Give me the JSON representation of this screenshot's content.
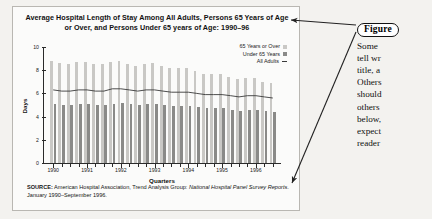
{
  "figure": {
    "title": "Average Hospital Length of Stay Among All Adults, Persons 65 Years of Age or Over, and Persons Under 65 years of Age: 1990–96",
    "source_prefix": "SOURCE:",
    "source_text_1": "American Hospital Association, Trend Analysis Group:",
    "source_italic": "National Hospital Panel Survey Reports",
    "source_text_2": ". January 1990–September 1996."
  },
  "callout": {
    "badge": "Figure",
    "lines": [
      "Some",
      "tell wr",
      "title, a",
      "Others",
      "should",
      "others",
      "below,",
      "expect",
      "reader"
    ]
  },
  "legend": {
    "items": [
      {
        "label": "65 Years or Over",
        "marker": "square-light-gray",
        "color": "#c9c8c5"
      },
      {
        "label": "Under 65 Years",
        "marker": "square-dark-gray",
        "color": "#8a8a88"
      },
      {
        "label": "All Adults",
        "marker": "line-dash",
        "color": "#3a3a3a"
      }
    ]
  },
  "chart_data": {
    "type": "bar",
    "title": "Average Hospital Length of Stay Among All Adults, Persons 65 Years of Age or Over, and Persons Under 65 years of Age: 1990–96",
    "xlabel": "Quarters",
    "ylabel": "Days",
    "ylim": [
      0,
      10
    ],
    "yticks": [
      0,
      2,
      4,
      6,
      8,
      10
    ],
    "ytick_labels": [
      "0",
      "2",
      "4",
      "6",
      "8",
      "10"
    ],
    "grid": false,
    "legend_position": "top-right",
    "x_axis_year_labels": [
      "1990",
      "1991",
      "1992",
      "1993",
      "1994",
      "1995",
      "1996"
    ],
    "x": [
      "1990 Q1",
      "1990 Q2",
      "1990 Q3",
      "1990 Q4",
      "1991 Q1",
      "1991 Q2",
      "1991 Q3",
      "1991 Q4",
      "1992 Q1",
      "1992 Q2",
      "1992 Q3",
      "1992 Q4",
      "1993 Q1",
      "1993 Q2",
      "1993 Q3",
      "1993 Q4",
      "1994 Q1",
      "1994 Q2",
      "1994 Q3",
      "1994 Q4",
      "1995 Q1",
      "1995 Q2",
      "1995 Q3",
      "1995 Q4",
      "1996 Q1",
      "1996 Q2",
      "1996 Q3"
    ],
    "series": [
      {
        "name": "65 Years or Over",
        "type": "bar",
        "color": "#c9c8c5",
        "values": [
          8.8,
          8.6,
          8.5,
          8.7,
          8.7,
          8.5,
          8.5,
          8.7,
          8.8,
          8.5,
          8.4,
          8.5,
          8.6,
          8.4,
          8.2,
          8.2,
          8.2,
          7.9,
          7.7,
          7.7,
          7.7,
          7.4,
          7.2,
          7.3,
          7.3,
          7.0,
          6.9
        ]
      },
      {
        "name": "Under 65 Years",
        "type": "bar",
        "color": "#8a8a88",
        "values": [
          5.1,
          5.0,
          5.0,
          5.1,
          5.1,
          5.0,
          5.0,
          5.1,
          5.2,
          5.1,
          5.0,
          5.1,
          5.1,
          5.0,
          4.9,
          4.9,
          4.9,
          4.8,
          4.7,
          4.7,
          4.7,
          4.6,
          4.5,
          4.6,
          4.6,
          4.5,
          4.4
        ]
      },
      {
        "name": "All Adults",
        "type": "line",
        "color": "#3a3a3a",
        "values": [
          6.3,
          6.2,
          6.2,
          6.3,
          6.3,
          6.2,
          6.2,
          6.4,
          6.4,
          6.3,
          6.2,
          6.3,
          6.3,
          6.2,
          6.1,
          6.1,
          6.1,
          6.0,
          5.9,
          5.9,
          5.9,
          5.8,
          5.7,
          5.8,
          5.8,
          5.7,
          5.6
        ]
      }
    ]
  }
}
